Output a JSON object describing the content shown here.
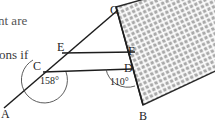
{
  "figure": {
    "background_color": "#ffffff",
    "line_color": "#1d1d1d",
    "shape_fill_color": "#a8a8a8",
    "hatch_color": "#ffffff",
    "text_color": "#1d1d1d"
  },
  "cropped_text": {
    "line_top": "nt are",
    "line_bottom": "ons if"
  },
  "vertices": [
    {
      "id": "A",
      "label": "A",
      "x": 5,
      "y": 111
    },
    {
      "id": "B",
      "label": "B",
      "x": 144,
      "y": 113
    },
    {
      "id": "C",
      "label": "C",
      "x": 38,
      "y": 64
    },
    {
      "id": "D",
      "label": "D",
      "x": 127,
      "y": 67
    },
    {
      "id": "E",
      "label": "E",
      "x": 62,
      "y": 45
    },
    {
      "id": "F",
      "label": "F",
      "x": 130,
      "y": 50
    },
    {
      "id": "G",
      "label": "G",
      "x": 114,
      "y": 9
    }
  ],
  "angles": [
    {
      "id": "angle-C",
      "label": "158°",
      "value": 158,
      "at_vertex": "C",
      "x": 53,
      "y": 80
    },
    {
      "id": "angle-D",
      "label": "110°",
      "value": 110,
      "at_vertex": "D",
      "x": 123,
      "y": 81
    }
  ],
  "segments": [
    {
      "id": "line-AG",
      "from": "A",
      "to": "G",
      "description": "transversal-line-A-to-G"
    },
    {
      "id": "line-CD",
      "from": "C",
      "to": "D",
      "description": "horizontal-line-C-to-D"
    },
    {
      "id": "line-EF",
      "from": "E",
      "to": "F",
      "description": "horizontal-line-E-to-F"
    },
    {
      "id": "line-GB",
      "from": "G",
      "to": "B",
      "description": "left-edge-of-rectangle"
    }
  ],
  "rectangle": {
    "id": "shaded-rectangle",
    "points": "116,7 210,-18 236,61 142,104",
    "description": "tilted-crosshatched-rectangle-G-B"
  }
}
